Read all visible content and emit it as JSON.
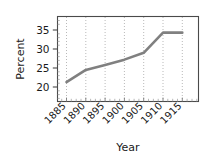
{
  "chart_data": {
    "type": "line",
    "title": "",
    "xlabel": "Year",
    "ylabel": "Percent",
    "x": [
      1885,
      1890,
      1895,
      1900,
      1905,
      1910,
      1915
    ],
    "values": [
      21.3,
      24.5,
      25.8,
      27.2,
      29.0,
      34.3,
      34.3
    ],
    "series": [
      {
        "name": "Percent",
        "values": [
          21.3,
          24.5,
          25.8,
          27.2,
          29.0,
          34.3,
          34.3
        ]
      }
    ],
    "categories": [
      "1885",
      "1890",
      "1895",
      "1900",
      "1905",
      "1910",
      "1915"
    ],
    "xtick_labels": [
      "1885",
      "1890",
      "1895",
      "1900",
      "1905",
      "1910",
      "1915"
    ],
    "ytick_labels": [
      "20",
      "25",
      "30",
      "35"
    ],
    "ytick_values": [
      20,
      25,
      30,
      35
    ],
    "xlim": [
      1882.5,
      1917.5
    ],
    "ylim": [
      17.5,
      37.5
    ],
    "grid": true,
    "grid_style": "dotted-vertical",
    "legend": false,
    "legend_position": "none",
    "line_color": "#808080",
    "grid_color": "#b9b9b9",
    "axis_color": "#4a4a4a",
    "text_color": "#1a1a1a",
    "xtick_label_rotation": 45
  },
  "axes": {
    "y_title": "Percent",
    "x_title": "Year",
    "y_ticks": [
      {
        "label": "35",
        "value": 35
      },
      {
        "label": "30",
        "value": 30
      },
      {
        "label": "25",
        "value": 25
      },
      {
        "label": "20",
        "value": 20
      }
    ],
    "x_ticks": [
      {
        "label": "1885",
        "value": 1885
      },
      {
        "label": "1890",
        "value": 1890
      },
      {
        "label": "1895",
        "value": 1895
      },
      {
        "label": "1900",
        "value": 1900
      },
      {
        "label": "1905",
        "value": 1905
      },
      {
        "label": "1910",
        "value": 1910
      },
      {
        "label": "1915",
        "value": 1915
      }
    ]
  }
}
